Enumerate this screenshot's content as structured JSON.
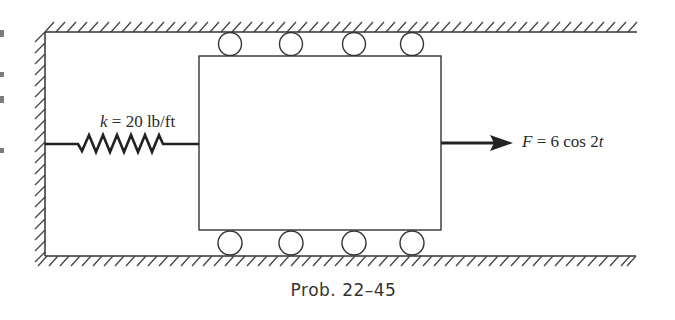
{
  "figure": {
    "caption": "Prob. 22–45",
    "spring": {
      "label": "k = 20 lb/ft",
      "symbol": "k",
      "value": 20,
      "units": "lb/ft"
    },
    "force": {
      "label": "F = 6 cos 2t",
      "symbol": "F",
      "expression": "6 cos 2t",
      "direction": "right"
    },
    "block": {
      "shape": "rectangle",
      "rollers_top": 4,
      "rollers_bottom": 4
    },
    "walls": [
      "top",
      "left",
      "bottom"
    ],
    "colors": {
      "line": "#333333",
      "hatch": "#444444",
      "arrow": "#222222",
      "background": "#ffffff"
    }
  }
}
